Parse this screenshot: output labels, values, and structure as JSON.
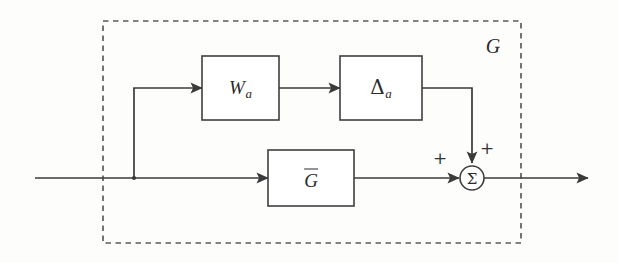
{
  "figure": {
    "kind": "control-block-diagram",
    "background_color": "#fdfdfc",
    "line_color": "#3a3a3a",
    "block_stroke_color": "#3f3f3f",
    "envelope_stroke_color": "#5b5b5b"
  },
  "envelope": {
    "label": "G",
    "style": "dashed",
    "x": 103,
    "y": 21,
    "width": 418,
    "height": 222
  },
  "blocks": [
    {
      "id": "wa",
      "name": "weight-block",
      "symbol": "W",
      "subscript": "a",
      "overbar": false,
      "x": 202,
      "y": 56,
      "width": 77,
      "height": 64
    },
    {
      "id": "delta-a",
      "name": "uncertainty-block",
      "symbol": "Δ",
      "subscript": "a",
      "overbar": false,
      "x": 340,
      "y": 56,
      "width": 82,
      "height": 64
    },
    {
      "id": "gbar",
      "name": "nominal-plant-block",
      "symbol": "G",
      "subscript": "",
      "overbar": true,
      "x": 268,
      "y": 150,
      "width": 86,
      "height": 56
    }
  ],
  "summing_junction": {
    "id": "sum",
    "symbol": "Σ",
    "cx": 472,
    "cy": 178,
    "r": 12,
    "signs": [
      {
        "label": "+",
        "input": "nominal-path",
        "x": 440,
        "y": 158
      },
      {
        "label": "+",
        "input": "uncertainty-path",
        "x": 487,
        "y": 148
      }
    ]
  },
  "nodes": {
    "input_start_x": 35,
    "input_y": 178,
    "branch_x": 134,
    "upper_y": 88,
    "feedback_x": 472,
    "output_end_x": 588
  },
  "signals": [
    {
      "name": "input-signal",
      "from": "input-terminal",
      "to": "branch-point"
    },
    {
      "name": "branch-to-wa",
      "from": "branch-point",
      "to": "weight-block"
    },
    {
      "name": "wa-to-delta",
      "from": "weight-block",
      "to": "uncertainty-block"
    },
    {
      "name": "delta-to-sum",
      "from": "uncertainty-block",
      "to": "summing-junction"
    },
    {
      "name": "branch-to-gbar",
      "from": "branch-point",
      "to": "nominal-plant-block"
    },
    {
      "name": "gbar-to-sum",
      "from": "nominal-plant-block",
      "to": "summing-junction"
    },
    {
      "name": "output-signal",
      "from": "summing-junction",
      "to": "output-terminal"
    }
  ]
}
